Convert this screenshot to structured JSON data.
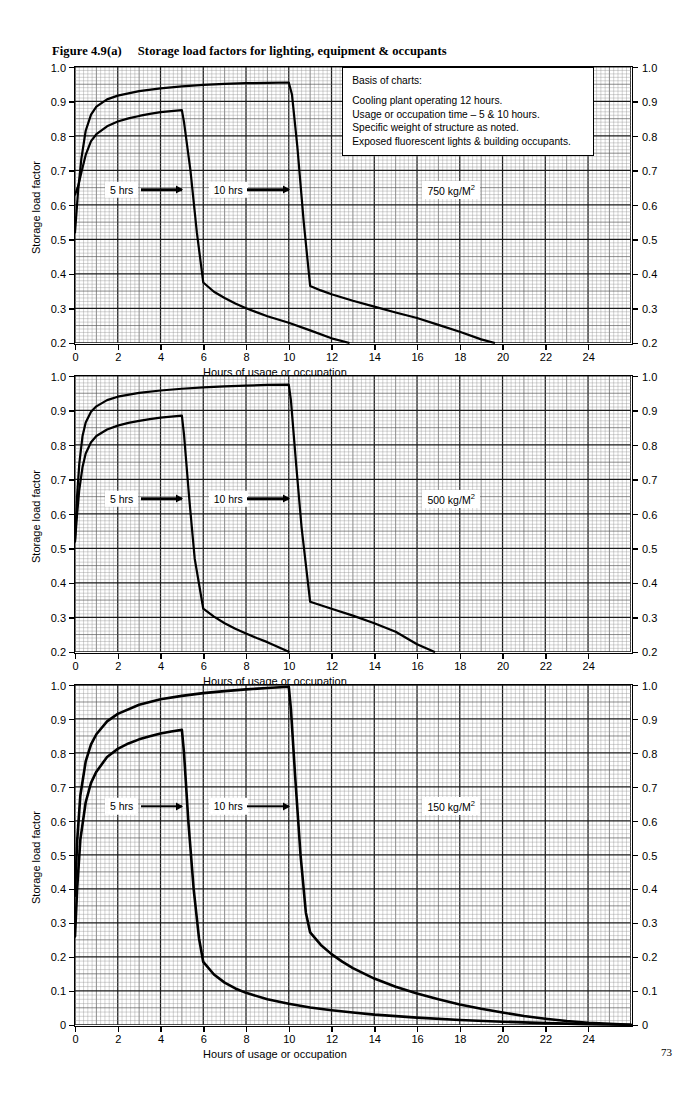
{
  "figure": {
    "number": "Figure 4.9(a)",
    "title": "Storage load factors for lighting, equipment & occupants",
    "page_number": "73"
  },
  "legend": {
    "heading": "Basis of charts:",
    "lines": [
      "Cooling plant operating 12 hours.",
      "Usage or occupation time – 5 & 10 hours.",
      "Specific weight of structure as noted.",
      "Exposed fluorescent lights & building occupants."
    ]
  },
  "annotations": {
    "curve_5hr": "5 hrs",
    "curve_10hr": "10 hrs"
  },
  "axes": {
    "xlabel": "Hours of usage or occupation",
    "ylabel": "Storage load factor",
    "xticks": [
      "0",
      "2",
      "4",
      "6",
      "8",
      "10",
      "12",
      "14",
      "16",
      "18",
      "20",
      "22",
      "24"
    ],
    "yticks_a": [
      "1.0",
      "0.9",
      "0.8",
      "0.7",
      "0.6",
      "0.5",
      "0.4",
      "0.3",
      "0.2"
    ],
    "yticks_c": [
      "1.0",
      "0.9",
      "0.8",
      "0.7",
      "0.6",
      "0.5",
      "0.4",
      "0.3",
      "0.2",
      "0.1",
      "0"
    ]
  },
  "chart_data": [
    {
      "type": "line",
      "title": "750 kg/M2",
      "weight_label": "750 kg/M",
      "weight_exp": "2",
      "xlabel": "Hours of usage or occupation",
      "ylabel": "Storage load factor",
      "xlim": [
        0,
        26
      ],
      "ylim": [
        0.2,
        1.0
      ],
      "xticks": [
        0,
        2,
        4,
        6,
        8,
        10,
        12,
        14,
        16,
        18,
        20,
        22,
        24
      ],
      "yticks": [
        0.2,
        0.3,
        0.4,
        0.5,
        0.6,
        0.7,
        0.8,
        0.9,
        1.0
      ],
      "grid": true,
      "legend_position": "top-right",
      "series": [
        {
          "name": "5 hrs",
          "x": [
            0,
            0.15,
            0.3,
            0.5,
            0.75,
            1.0,
            1.5,
            2.0,
            2.5,
            3.0,
            3.5,
            4.0,
            4.5,
            5.0,
            5.1,
            5.4,
            5.7,
            6.0,
            6.5,
            7.0,
            7.5,
            8.0,
            9.0,
            10.0,
            11.0,
            12.0,
            12.8
          ],
          "y": [
            0.63,
            0.655,
            0.695,
            0.745,
            0.785,
            0.805,
            0.828,
            0.842,
            0.851,
            0.858,
            0.864,
            0.869,
            0.872,
            0.875,
            0.84,
            0.7,
            0.52,
            0.375,
            0.348,
            0.33,
            0.314,
            0.3,
            0.277,
            0.258,
            0.236,
            0.213,
            0.2
          ]
        },
        {
          "name": "10 hrs",
          "x": [
            0,
            0.15,
            0.3,
            0.5,
            0.75,
            1.0,
            1.5,
            2.0,
            3.0,
            4.0,
            5.0,
            6.0,
            7.0,
            8.0,
            9.0,
            10.0,
            10.15,
            10.4,
            10.7,
            11.0,
            11.5,
            12.0,
            13.0,
            14.0,
            15.0,
            16.0,
            17.0,
            18.0,
            19.0,
            19.6
          ],
          "y": [
            0.52,
            0.645,
            0.735,
            0.815,
            0.862,
            0.885,
            0.906,
            0.917,
            0.93,
            0.938,
            0.944,
            0.948,
            0.951,
            0.953,
            0.954,
            0.955,
            0.92,
            0.77,
            0.55,
            0.365,
            0.352,
            0.341,
            0.322,
            0.305,
            0.288,
            0.272,
            0.252,
            0.232,
            0.21,
            0.2
          ]
        }
      ]
    },
    {
      "type": "line",
      "title": "500 kg/M2",
      "weight_label": "500 kg/M",
      "weight_exp": "2",
      "xlabel": "Hours of usage or occupation",
      "ylabel": "Storage load factor",
      "xlim": [
        0,
        26
      ],
      "ylim": [
        0.2,
        1.0
      ],
      "xticks": [
        0,
        2,
        4,
        6,
        8,
        10,
        12,
        14,
        16,
        18,
        20,
        22,
        24
      ],
      "yticks": [
        0.2,
        0.3,
        0.4,
        0.5,
        0.6,
        0.7,
        0.8,
        0.9,
        1.0
      ],
      "grid": true,
      "series": [
        {
          "name": "5 hrs",
          "x": [
            0,
            0.1,
            0.2,
            0.35,
            0.5,
            0.75,
            1.0,
            1.5,
            2.0,
            2.5,
            3.0,
            3.5,
            4.0,
            4.5,
            5.0,
            5.1,
            5.35,
            5.6,
            6.0,
            6.5,
            7.0,
            7.5,
            8.0,
            8.5,
            9.0,
            9.5,
            10.0
          ],
          "y": [
            0.52,
            0.6,
            0.67,
            0.735,
            0.775,
            0.808,
            0.826,
            0.845,
            0.856,
            0.864,
            0.87,
            0.875,
            0.879,
            0.882,
            0.885,
            0.83,
            0.64,
            0.47,
            0.325,
            0.302,
            0.283,
            0.267,
            0.253,
            0.24,
            0.228,
            0.214,
            0.2
          ]
        },
        {
          "name": "10 hrs",
          "x": [
            0,
            0.1,
            0.2,
            0.35,
            0.5,
            0.75,
            1.0,
            1.5,
            2.0,
            3.0,
            4.0,
            5.0,
            6.0,
            7.0,
            8.0,
            9.0,
            10.0,
            10.1,
            10.35,
            10.6,
            11.0,
            11.5,
            12.0,
            13.0,
            14.0,
            15.0,
            16.0,
            16.8
          ],
          "y": [
            0.52,
            0.655,
            0.745,
            0.825,
            0.865,
            0.896,
            0.912,
            0.93,
            0.94,
            0.951,
            0.958,
            0.963,
            0.967,
            0.97,
            0.972,
            0.974,
            0.975,
            0.93,
            0.74,
            0.56,
            0.345,
            0.335,
            0.325,
            0.305,
            0.283,
            0.258,
            0.222,
            0.2
          ]
        }
      ]
    },
    {
      "type": "line",
      "title": "150 kg/M2",
      "weight_label": "150 kg/M",
      "weight_exp": "2",
      "xlabel": "Hours of usage or occupation",
      "ylabel": "Storage load factor",
      "xlim": [
        0,
        26
      ],
      "ylim": [
        0.0,
        1.0
      ],
      "xticks": [
        0,
        2,
        4,
        6,
        8,
        10,
        12,
        14,
        16,
        18,
        20,
        22,
        24
      ],
      "yticks": [
        0.0,
        0.1,
        0.2,
        0.3,
        0.4,
        0.5,
        0.6,
        0.7,
        0.8,
        0.9,
        1.0
      ],
      "grid": true,
      "series": [
        {
          "name": "5 hrs",
          "x": [
            0,
            0.1,
            0.25,
            0.5,
            0.75,
            1.0,
            1.5,
            2.0,
            2.5,
            3.0,
            3.5,
            4.0,
            4.5,
            5.0,
            5.1,
            5.3,
            5.55,
            5.8,
            6.0,
            6.5,
            7.0,
            7.5,
            8.0,
            9.0,
            10.0,
            11.0,
            12.0,
            13.0,
            14.0,
            16.0,
            18.0,
            20.0,
            22.0,
            24.0,
            26.0
          ],
          "y": [
            0.26,
            0.4,
            0.545,
            0.655,
            0.712,
            0.745,
            0.788,
            0.812,
            0.828,
            0.84,
            0.849,
            0.857,
            0.863,
            0.868,
            0.8,
            0.6,
            0.4,
            0.255,
            0.185,
            0.148,
            0.124,
            0.107,
            0.094,
            0.075,
            0.062,
            0.051,
            0.043,
            0.036,
            0.03,
            0.021,
            0.014,
            0.009,
            0.005,
            0.002,
            0.0
          ]
        },
        {
          "name": "10 hrs",
          "x": [
            0,
            0.1,
            0.25,
            0.5,
            0.75,
            1.0,
            1.5,
            2.0,
            3.0,
            4.0,
            5.0,
            6.0,
            7.0,
            8.0,
            9.0,
            10.0,
            10.1,
            10.3,
            10.55,
            10.8,
            11.0,
            11.5,
            12.0,
            12.5,
            13.0,
            14.0,
            15.0,
            16.0,
            17.0,
            18.0,
            19.0,
            20.0,
            21.0,
            22.0,
            23.0,
            24.0,
            26.0
          ],
          "y": [
            0.38,
            0.54,
            0.675,
            0.775,
            0.825,
            0.855,
            0.893,
            0.915,
            0.942,
            0.958,
            0.968,
            0.976,
            0.982,
            0.987,
            0.991,
            0.995,
            0.93,
            0.73,
            0.5,
            0.33,
            0.272,
            0.235,
            0.208,
            0.186,
            0.167,
            0.136,
            0.112,
            0.092,
            0.075,
            0.06,
            0.047,
            0.036,
            0.026,
            0.018,
            0.011,
            0.006,
            0.0
          ]
        }
      ]
    }
  ]
}
